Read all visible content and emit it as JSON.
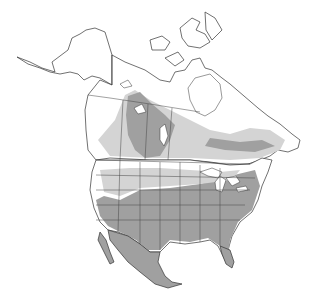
{
  "map": {
    "type": "species range map",
    "region": "North America",
    "legend": [],
    "labels": [],
    "colors": {
      "background": "#ffffff",
      "land": "#ffffff",
      "range_primary": "#a0a0a0",
      "range_secondary": "#d4d4d4",
      "outline": "#333333"
    }
  }
}
